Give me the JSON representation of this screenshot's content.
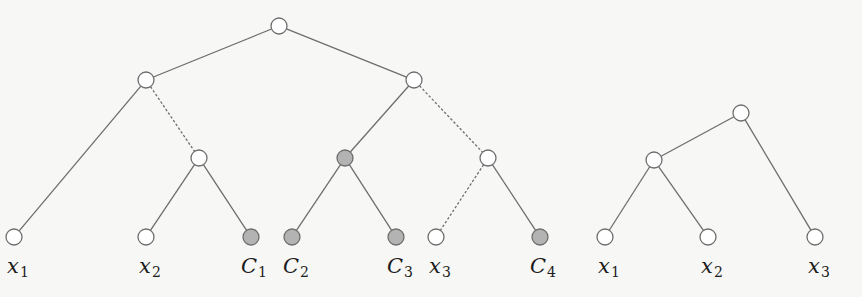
{
  "colors": {
    "background": "#f7f7f5",
    "edge": "#6e6e6e",
    "node_stroke": "#6e6e6e",
    "node_fill": "#ffffff",
    "shaded_fill": "#b3b3b3",
    "label": "#1c1c1c"
  },
  "node_radius": 8,
  "trees": [
    {
      "name": "tree-left",
      "nodes": [
        {
          "id": "r",
          "x": 279,
          "y": 26,
          "shaded": false
        },
        {
          "id": "a",
          "x": 146,
          "y": 80,
          "shaded": false
        },
        {
          "id": "b",
          "x": 414,
          "y": 80,
          "shaded": false
        },
        {
          "id": "c",
          "x": 199,
          "y": 158,
          "shaded": false
        },
        {
          "id": "d",
          "x": 345,
          "y": 158,
          "shaded": true
        },
        {
          "id": "e",
          "x": 488,
          "y": 158,
          "shaded": false
        },
        {
          "id": "x1",
          "x": 14,
          "y": 237,
          "shaded": false,
          "label": {
            "base": "x",
            "sub": "1"
          }
        },
        {
          "id": "x2",
          "x": 146,
          "y": 237,
          "shaded": false,
          "label": {
            "base": "x",
            "sub": "2"
          }
        },
        {
          "id": "C1",
          "x": 251,
          "y": 237,
          "shaded": true,
          "label": {
            "base": "C",
            "sub": "1"
          }
        },
        {
          "id": "C2",
          "x": 292,
          "y": 237,
          "shaded": true,
          "label": {
            "base": "C",
            "sub": "2"
          }
        },
        {
          "id": "C3",
          "x": 396,
          "y": 237,
          "shaded": true,
          "label": {
            "base": "C",
            "sub": "3"
          }
        },
        {
          "id": "x3",
          "x": 436,
          "y": 237,
          "shaded": false,
          "label": {
            "base": "x",
            "sub": "3"
          }
        },
        {
          "id": "C4",
          "x": 540,
          "y": 237,
          "shaded": true,
          "label": {
            "base": "C",
            "sub": "4"
          }
        }
      ],
      "edges": [
        {
          "from": "r",
          "to": "a",
          "dashed": false
        },
        {
          "from": "r",
          "to": "b",
          "dashed": false
        },
        {
          "from": "a",
          "to": "x1",
          "dashed": false
        },
        {
          "from": "a",
          "to": "c",
          "dashed": true
        },
        {
          "from": "c",
          "to": "x2",
          "dashed": false
        },
        {
          "from": "c",
          "to": "C1",
          "dashed": false
        },
        {
          "from": "b",
          "to": "d",
          "dashed": false
        },
        {
          "from": "b",
          "to": "e",
          "dashed": true
        },
        {
          "from": "d",
          "to": "C2",
          "dashed": false
        },
        {
          "from": "d",
          "to": "C3",
          "dashed": false
        },
        {
          "from": "e",
          "to": "x3",
          "dashed": true
        },
        {
          "from": "e",
          "to": "C4",
          "dashed": false
        }
      ]
    },
    {
      "name": "tree-right",
      "nodes": [
        {
          "id": "r2",
          "x": 741,
          "y": 113,
          "shaded": false
        },
        {
          "id": "f",
          "x": 654,
          "y": 160,
          "shaded": false
        },
        {
          "id": "y1",
          "x": 605,
          "y": 237,
          "shaded": false,
          "label": {
            "base": "x",
            "sub": "1"
          }
        },
        {
          "id": "y2",
          "x": 708,
          "y": 237,
          "shaded": false,
          "label": {
            "base": "x",
            "sub": "2"
          }
        },
        {
          "id": "y3",
          "x": 815,
          "y": 237,
          "shaded": false,
          "label": {
            "base": "x",
            "sub": "3"
          }
        }
      ],
      "edges": [
        {
          "from": "r2",
          "to": "f",
          "dashed": false
        },
        {
          "from": "r2",
          "to": "y3",
          "dashed": false
        },
        {
          "from": "f",
          "to": "y1",
          "dashed": false
        },
        {
          "from": "f",
          "to": "y2",
          "dashed": false
        }
      ]
    }
  ],
  "labels": [
    {
      "name": "label-x1-left",
      "base": "x",
      "sub": "1",
      "x": 18,
      "y": 256
    },
    {
      "name": "label-x2-left",
      "base": "x",
      "sub": "2",
      "x": 150,
      "y": 256
    },
    {
      "name": "label-C1",
      "base": "C",
      "sub": "1",
      "x": 254,
      "y": 256
    },
    {
      "name": "label-C2",
      "base": "C",
      "sub": "2",
      "x": 296,
      "y": 256
    },
    {
      "name": "label-C3",
      "base": "C",
      "sub": "3",
      "x": 400,
      "y": 256
    },
    {
      "name": "label-x3-left",
      "base": "x",
      "sub": "3",
      "x": 440,
      "y": 256
    },
    {
      "name": "label-C4",
      "base": "C",
      "sub": "4",
      "x": 543,
      "y": 256
    },
    {
      "name": "label-x1-right",
      "base": "x",
      "sub": "1",
      "x": 609,
      "y": 256
    },
    {
      "name": "label-x2-right",
      "base": "x",
      "sub": "2",
      "x": 712,
      "y": 256
    },
    {
      "name": "label-x3-right",
      "base": "x",
      "sub": "3",
      "x": 819,
      "y": 256
    }
  ]
}
